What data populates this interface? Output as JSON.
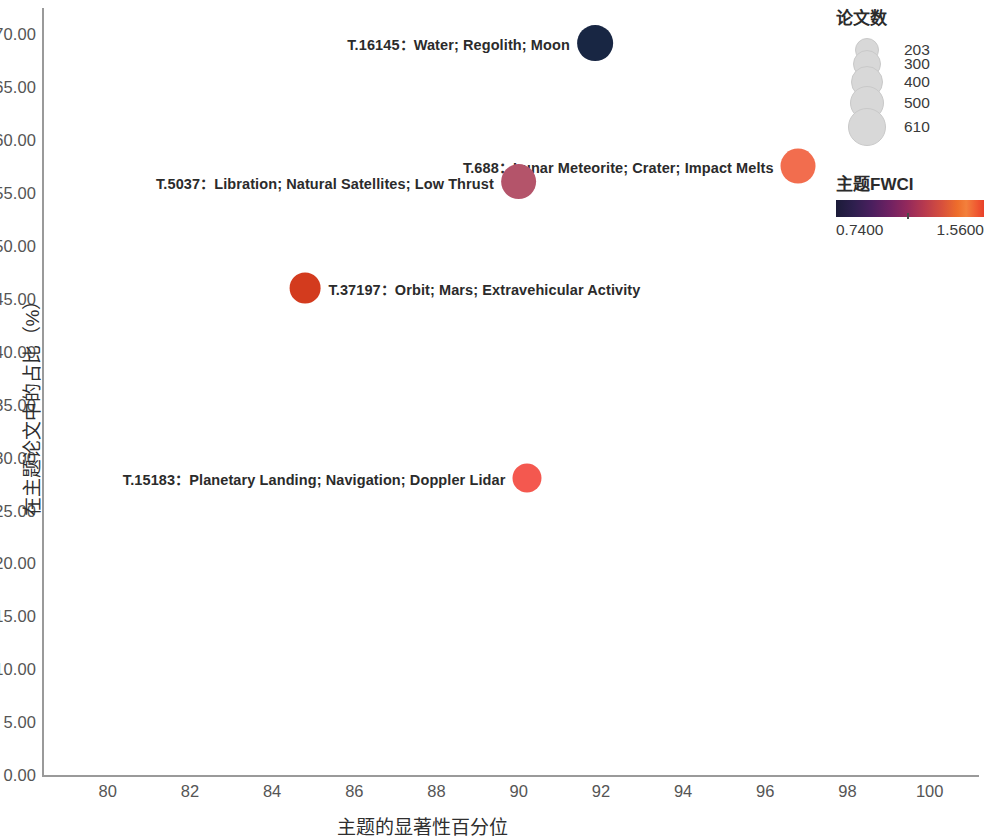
{
  "chart_data": {
    "type": "scatter",
    "title": "",
    "xlabel": "主题的显著性百分位",
    "ylabel": "在主题论文中的占比（%）",
    "xlim": [
      78.4,
      101.2
    ],
    "ylim": [
      0,
      72.5
    ],
    "xticks": [
      80,
      82,
      84,
      86,
      88,
      90,
      92,
      94,
      96,
      98,
      100
    ],
    "xtick_labels": [
      "80",
      "82",
      "84",
      "86",
      "88",
      "90",
      "92",
      "94",
      "96",
      "98",
      "100"
    ],
    "yticks": [
      0,
      5,
      10,
      15,
      20,
      25,
      30,
      35,
      40,
      45,
      50,
      55,
      60,
      65,
      70
    ],
    "ytick_labels": [
      "0.00",
      "5.00",
      "10.00",
      "15.00",
      "20.00",
      "25.00",
      "30.00",
      "35.00",
      "40.00",
      "45.00",
      "50.00",
      "55.00",
      "60.00",
      "65.00",
      "70.00"
    ],
    "grid": false,
    "size_field": "论文数",
    "color_field": "主题FWCI",
    "points": [
      {
        "id": "T.16145",
        "label": "T.16145：Water; Regolith; Moon",
        "x": 91.85,
        "y": 69.2,
        "size": 610,
        "color": "#182643",
        "label_side": "left"
      },
      {
        "id": "T.688",
        "label": "T.688：Lunar Meteorite; Crater; Impact Melts",
        "x": 96.8,
        "y": 57.6,
        "size": 560,
        "color": "#f26d4e",
        "label_side": "left"
      },
      {
        "id": "T.5037",
        "label": "T.5037：Libration; Natural Satellites; Low Thrust",
        "x": 90.0,
        "y": 56.1,
        "size": 610,
        "color": "#b4546a",
        "label_side": "left"
      },
      {
        "id": "T.37197",
        "label": "T.37197：Orbit; Mars; Extravehicular Activity",
        "x": 84.8,
        "y": 46.0,
        "size": 330,
        "color": "#d33b1e",
        "label_side": "right"
      },
      {
        "id": "T.15183",
        "label": "T.15183：Planetary Landing; Navigation; Doppler Lidar",
        "x": 90.2,
        "y": 28.1,
        "size": 250,
        "color": "#f4584f",
        "label_side": "left"
      }
    ]
  },
  "size_legend": {
    "title": "论文数",
    "entries": [
      {
        "value": "203",
        "radius": 11
      },
      {
        "value": "300",
        "radius": 13
      },
      {
        "value": "400",
        "radius": 15
      },
      {
        "value": "500",
        "radius": 16
      },
      {
        "value": "610",
        "radius": 18
      }
    ]
  },
  "color_legend": {
    "title": "主题FWCI",
    "min": "0.7400",
    "max": "1.5600"
  }
}
